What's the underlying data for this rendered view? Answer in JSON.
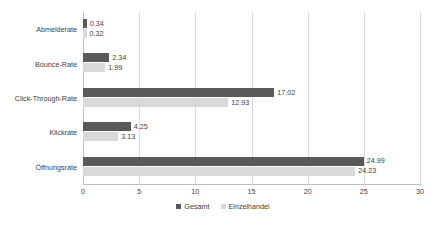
{
  "chart_data": {
    "type": "bar",
    "orientation": "horizontal",
    "title": "",
    "subtitle": "",
    "xlabel": "",
    "ylabel": "",
    "xlim": [
      0,
      30
    ],
    "xticks": [
      0,
      5,
      10,
      15,
      20,
      25,
      30
    ],
    "xtick_labels": [
      "0",
      "5",
      "10",
      "15",
      "20",
      "25",
      "30"
    ],
    "grid": true,
    "grid_axis": "x",
    "legend_position": "bottom-center",
    "categories": [
      "Abmelderate",
      "Bounce-Rate",
      "Click-Through-Rate",
      "Klickrate",
      "Öffnungsrate"
    ],
    "series": [
      {
        "name": "Gesamt",
        "color": "#595959",
        "values": [
          0.34,
          2.34,
          17.02,
          4.25,
          24.99
        ],
        "labels": [
          "0.34",
          "2.34",
          "17.02",
          "4.25",
          "24.99"
        ]
      },
      {
        "name": "Einzelhandel",
        "color": "#d9d9d9",
        "values": [
          0.32,
          1.99,
          12.93,
          3.13,
          24.23
        ],
        "labels": [
          "0.32",
          "1.99",
          "12.93",
          "3.13",
          "24.23"
        ]
      }
    ]
  },
  "colors": {
    "background": "#ffffff",
    "gridline": "#d9d9d9",
    "axis": "#bfbfbf",
    "text": "#404040",
    "series_gesamt": "#595959",
    "series_einzelhandel": "#d9d9d9"
  }
}
